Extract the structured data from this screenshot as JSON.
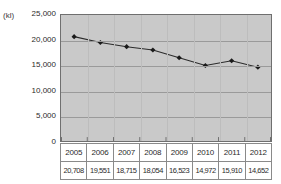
{
  "chart_data": {
    "type": "line",
    "title": "",
    "xlabel": "",
    "ylabel": "",
    "unit_label": "(kl)",
    "categories": [
      "2005",
      "2006",
      "2007",
      "2008",
      "2009",
      "2010",
      "2011",
      "2012"
    ],
    "values": [
      20708,
      19551,
      18715,
      18054,
      16523,
      14972,
      15910,
      14652
    ],
    "value_labels": [
      "20,708",
      "19,551",
      "18,715",
      "18,054",
      "16,523",
      "14,972",
      "15,910",
      "14,652"
    ],
    "ylim": [
      0,
      25000
    ],
    "ytick_labels": [
      "25,000",
      "20,000",
      "15,000",
      "10,000",
      "5,000",
      "0"
    ],
    "ytick_values": [
      25000,
      20000,
      15000,
      10000,
      5000,
      0
    ],
    "grid": true,
    "legend": "none",
    "marker": "diamond",
    "series": [
      {
        "name": "",
        "values": [
          20708,
          19551,
          18715,
          18054,
          16523,
          14972,
          15910,
          14652
        ]
      }
    ],
    "colors": {
      "plot_background": "#c9c9c9",
      "line": "#2b2b2b",
      "marker": "#1a1a1a",
      "gridline": "#9a9a9a",
      "axis_border": "#6f6f6f",
      "table_border": "#8a8a8a",
      "text": "#2b2b2b"
    }
  }
}
